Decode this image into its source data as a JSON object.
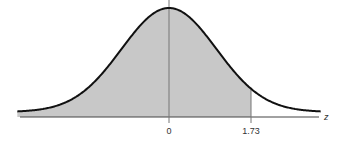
{
  "chart_data": {
    "type": "area",
    "title": "",
    "subtitle": "",
    "xlabel": "z",
    "ylabel": "",
    "xlim": [
      -3.2,
      3.2
    ],
    "grid": false,
    "legend": null,
    "curve": "standard_normal_pdf",
    "shaded_region": {
      "from": -3.2,
      "to": 1.73,
      "color": "#c8c8c8"
    },
    "reference_lines": [
      {
        "x": 0,
        "label": "0"
      },
      {
        "x": 1.73,
        "label": "1.73"
      }
    ],
    "tick_labels": [
      "0",
      "1.73"
    ],
    "colors": {
      "curve": "#111111",
      "fill": "#c8c8c8",
      "axis": "#444444",
      "ref_line": "#777777"
    }
  },
  "labels": {
    "tick_zero": "0",
    "tick_173": "1.73",
    "axis_z": "z"
  }
}
